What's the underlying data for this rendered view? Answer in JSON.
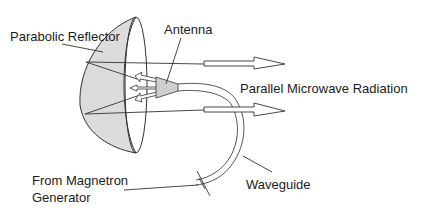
{
  "diagram": {
    "labels": {
      "reflector": "Parabolic Reflector",
      "antenna": "Antenna",
      "radiation": "Parallel Microwave Radiation",
      "source_line1": "From Magnetron",
      "source_line2": "Generator",
      "waveguide": "Waveguide"
    },
    "colors": {
      "stroke": "#333333",
      "reflector_fill": "#dcdcdc",
      "text": "#1c1c1c",
      "background": "#ffffff"
    }
  }
}
